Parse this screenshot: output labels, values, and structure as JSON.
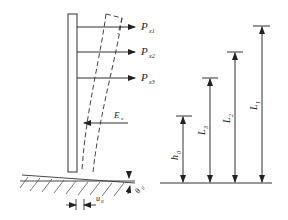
{
  "diagram": {
    "title": "",
    "forces": [
      {
        "symbol": "P",
        "subscript": "x1",
        "y": 27
      },
      {
        "symbol": "P",
        "subscript": "x2",
        "y": 52
      },
      {
        "symbol": "P",
        "subscript": "x3",
        "y": 78
      }
    ],
    "earth_pressure": {
      "symbol": "E",
      "subscript": "x"
    },
    "base_displacement": {
      "symbol": "u",
      "subscript": "0"
    },
    "base_rotation": {
      "symbol": "θ",
      "subscript": "0"
    },
    "dimensions": [
      {
        "symbol": "h",
        "subscript": "0"
      },
      {
        "symbol": "L",
        "subscript": "3"
      },
      {
        "symbol": "L",
        "subscript": "2"
      },
      {
        "symbol": "L",
        "subscript": "1"
      }
    ],
    "colors": {
      "line": "#333333",
      "background": "#ffffff"
    }
  }
}
